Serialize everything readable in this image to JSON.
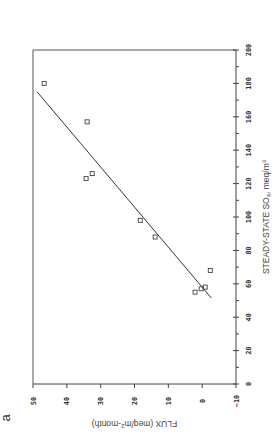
{
  "chart_data": {
    "type": "scatter",
    "orientation": "rotated 90 degrees counter-clockwise",
    "panel_label": "a",
    "xlabel": "STEADY-STATE SO4, meq/m3",
    "xlabel_parts": {
      "main": "STEADY-STATE SO",
      "sub": "4",
      "unit": ", meq/m",
      "sup": "3"
    },
    "ylabel": "FLUX (meq/m2-month)",
    "ylabel_parts": {
      "main": "FLUX (meq/m",
      "sup": "2",
      "rest": "-month)"
    },
    "xlim": [
      0,
      200
    ],
    "ylim": [
      -10,
      50
    ],
    "x_ticks": [
      0,
      20,
      40,
      60,
      80,
      100,
      120,
      140,
      160,
      180,
      200
    ],
    "x_tick_labels": [
      "0",
      "20",
      "40",
      "60",
      "80",
      "100",
      "120",
      "140",
      "160",
      "180",
      "200"
    ],
    "y_ticks": [
      -10,
      0,
      10,
      20,
      30,
      40,
      50
    ],
    "y_tick_labels": [
      "−10",
      "0",
      "10",
      "20",
      "30",
      "40",
      "50"
    ],
    "grid": false,
    "legend": null,
    "marker": "open-square",
    "points": [
      {
        "x": 180,
        "y": 46.7
      },
      {
        "x": 157,
        "y": 34.0
      },
      {
        "x": 126,
        "y": 32.5
      },
      {
        "x": 123,
        "y": 34.3
      },
      {
        "x": 98,
        "y": 18.3
      },
      {
        "x": 88,
        "y": 13.9
      },
      {
        "x": 68,
        "y": -2.4
      },
      {
        "x": 58,
        "y": -0.9
      },
      {
        "x": 57,
        "y": 0.3
      },
      {
        "x": 55,
        "y": 2.1
      }
    ],
    "fit_line": {
      "x": [
        51.5,
        175
      ],
      "y": [
        -2.7,
        48.8
      ]
    }
  }
}
